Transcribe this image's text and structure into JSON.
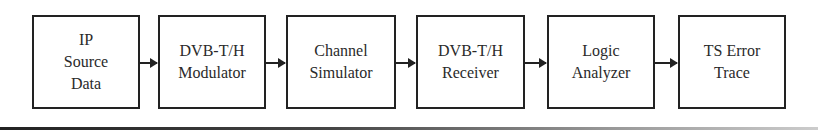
{
  "diagram": {
    "type": "block-flow",
    "direction": "left-to-right",
    "blocks": [
      {
        "id": "ip-source",
        "label": "IP\nSource\nData"
      },
      {
        "id": "modulator",
        "label": "DVB-T/H\nModulator"
      },
      {
        "id": "channel-sim",
        "label": "Channel\nSimulator"
      },
      {
        "id": "receiver",
        "label": "DVB-T/H\nReceiver"
      },
      {
        "id": "logic-analyzer",
        "label": "Logic\nAnalyzer"
      },
      {
        "id": "ts-error",
        "label": "TS Error\nTrace"
      }
    ],
    "edges": [
      {
        "from": "ip-source",
        "to": "modulator"
      },
      {
        "from": "modulator",
        "to": "channel-sim"
      },
      {
        "from": "channel-sim",
        "to": "receiver"
      },
      {
        "from": "receiver",
        "to": "logic-analyzer"
      },
      {
        "from": "logic-analyzer",
        "to": "ts-error"
      }
    ]
  }
}
